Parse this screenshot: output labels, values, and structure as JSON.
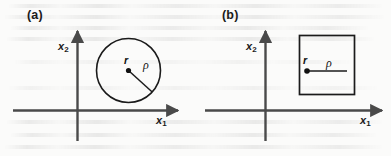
{
  "figure": {
    "width": 391,
    "height": 156,
    "background_color": "#fbfbfa",
    "ink_color": "#1b1b1b"
  },
  "panels": [
    {
      "id": "a",
      "label": "(a)",
      "shape": "circle",
      "axes": {
        "x_label": "x",
        "x_subscript": "1",
        "y_label": "x",
        "y_subscript": "2"
      },
      "center_label": "r",
      "radius_label": "ρ"
    },
    {
      "id": "b",
      "label": "(b)",
      "shape": "square",
      "axes": {
        "x_label": "x",
        "x_subscript": "1",
        "y_label": "x",
        "y_subscript": "2"
      },
      "center_label": "r",
      "radius_label": "ρ"
    }
  ]
}
